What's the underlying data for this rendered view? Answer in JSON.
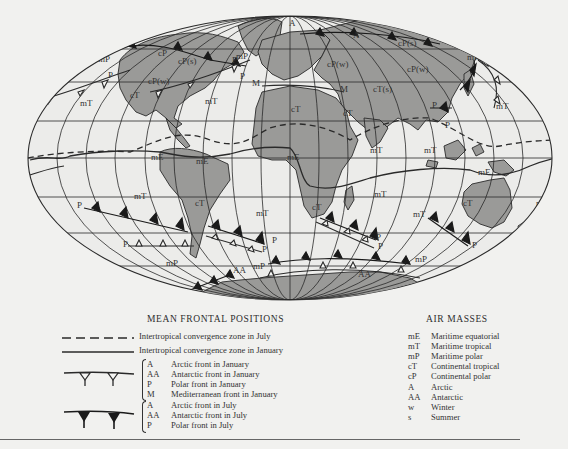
{
  "map": {
    "projection": "Mollweide-like world projection",
    "air_mass_labels": [
      {
        "text": "mP",
        "x": 98,
        "y": 62
      },
      {
        "text": "P",
        "x": 108,
        "y": 78
      },
      {
        "text": "mT",
        "x": 80,
        "y": 106
      },
      {
        "text": "cP",
        "x": 158,
        "y": 56
      },
      {
        "text": "cP(s)",
        "x": 178,
        "y": 64
      },
      {
        "text": "cP(w)",
        "x": 148,
        "y": 84
      },
      {
        "text": "cT",
        "x": 130,
        "y": 98
      },
      {
        "text": "mT",
        "x": 205,
        "y": 104
      },
      {
        "text": "mP",
        "x": 236,
        "y": 59
      },
      {
        "text": "P",
        "x": 232,
        "y": 63
      },
      {
        "text": "P",
        "x": 240,
        "y": 79
      },
      {
        "text": "A",
        "x": 289,
        "y": 26
      },
      {
        "text": "A",
        "x": 353,
        "y": 38
      },
      {
        "text": "cP(s)",
        "x": 398,
        "y": 46
      },
      {
        "text": "mP",
        "x": 467,
        "y": 60
      },
      {
        "text": "cP(w)",
        "x": 327,
        "y": 67
      },
      {
        "text": "cP(w)",
        "x": 407,
        "y": 72
      },
      {
        "text": "M",
        "x": 340,
        "y": 92
      },
      {
        "text": "M",
        "x": 252,
        "y": 86
      },
      {
        "text": "cT(s)",
        "x": 373,
        "y": 92
      },
      {
        "text": "cT",
        "x": 291,
        "y": 112
      },
      {
        "text": "cT",
        "x": 343,
        "y": 116
      },
      {
        "text": "P",
        "x": 432,
        "y": 108
      },
      {
        "text": "mT",
        "x": 496,
        "y": 109
      },
      {
        "text": "P",
        "x": 445,
        "y": 128
      },
      {
        "text": "mT",
        "x": 424,
        "y": 153
      },
      {
        "text": "mT",
        "x": 370,
        "y": 153
      },
      {
        "text": "mE",
        "x": 151,
        "y": 160
      },
      {
        "text": "mE",
        "x": 196,
        "y": 164
      },
      {
        "text": "mE",
        "x": 287,
        "y": 160
      },
      {
        "text": "mE",
        "x": 478,
        "y": 175
      },
      {
        "text": "mT",
        "x": 134,
        "y": 199
      },
      {
        "text": "cT",
        "x": 195,
        "y": 206
      },
      {
        "text": "mT",
        "x": 256,
        "y": 216
      },
      {
        "text": "cT",
        "x": 312,
        "y": 210
      },
      {
        "text": "mT",
        "x": 374,
        "y": 197
      },
      {
        "text": "mT",
        "x": 413,
        "y": 217
      },
      {
        "text": "cT",
        "x": 463,
        "y": 206
      },
      {
        "text": "mT",
        "x": 536,
        "y": 206
      },
      {
        "text": "P",
        "x": 77,
        "y": 208
      },
      {
        "text": "P",
        "x": 123,
        "y": 247
      },
      {
        "text": "P",
        "x": 272,
        "y": 243
      },
      {
        "text": "P",
        "x": 262,
        "y": 252
      },
      {
        "text": "P",
        "x": 376,
        "y": 240
      },
      {
        "text": "P",
        "x": 378,
        "y": 249
      },
      {
        "text": "P",
        "x": 472,
        "y": 248
      },
      {
        "text": "mP",
        "x": 166,
        "y": 266
      },
      {
        "text": "mP",
        "x": 253,
        "y": 269
      },
      {
        "text": "mP",
        "x": 415,
        "y": 262
      },
      {
        "text": "AA",
        "x": 233,
        "y": 273
      },
      {
        "text": "AA",
        "x": 358,
        "y": 277
      }
    ]
  },
  "legend": {
    "frontal_title": "MEAN FRONTAL POSITIONS",
    "itcz_july": "Intertropical convergence zone in July",
    "itcz_january": "Intertropical convergence zone in January",
    "january_fronts": [
      {
        "code": "A",
        "label": "Arctic front in January"
      },
      {
        "code": "AA",
        "label": "Antarctic front in January"
      },
      {
        "code": "P",
        "label": "Polar front in January"
      },
      {
        "code": "M",
        "label": "Mediterranean front in January"
      }
    ],
    "july_fronts": [
      {
        "code": "A",
        "label": "Arctic front in July"
      },
      {
        "code": "AA",
        "label": "Antarctic front in July"
      },
      {
        "code": "P",
        "label": "Polar front in July"
      }
    ],
    "air_masses_title": "AIR MASSES",
    "air_masses": [
      {
        "code": "mE",
        "label": "Maritime equatorial"
      },
      {
        "code": "mT",
        "label": "Maritime tropical"
      },
      {
        "code": "mP",
        "label": "Maritime polar"
      },
      {
        "code": "cT",
        "label": "Continental tropical"
      },
      {
        "code": "cP",
        "label": "Continental polar"
      },
      {
        "code": "A",
        "label": "Arctic"
      },
      {
        "code": "AA",
        "label": "Antarctic"
      },
      {
        "code": "w",
        "label": "Winter"
      },
      {
        "code": "s",
        "label": "Summer"
      }
    ]
  },
  "colors": {
    "background": "#f1f1ef",
    "ocean": "#ececea",
    "land": "#9a9a98",
    "lines": "#2a2a2a"
  }
}
